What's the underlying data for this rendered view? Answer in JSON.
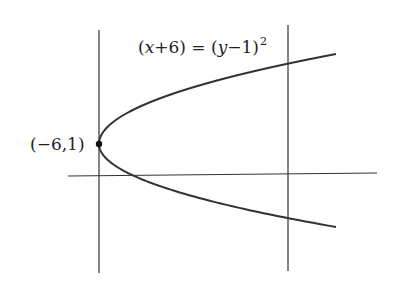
{
  "diagram": {
    "equation": {
      "lhs_open": "(",
      "var_x": "x",
      "lhs_rest": "+6) = (",
      "var_y": "y",
      "rhs_rest": "−1)",
      "exponent": "2"
    },
    "vertex_label": "(−6,1)",
    "colors": {
      "stroke": "#333333",
      "background": "#ffffff"
    }
  },
  "chart_data": {
    "type": "line",
    "curve": "parabola opening right, vertex (−6,1)",
    "vertex": {
      "x": -6,
      "y": 1,
      "label": "(−6,1)"
    },
    "lines": [
      {
        "kind": "vertical",
        "description": "line through vertex x = −6"
      },
      {
        "kind": "vertical",
        "description": "vertical line to the right"
      },
      {
        "kind": "horizontal",
        "description": "x-axis"
      }
    ],
    "grid": false,
    "legend": null
  }
}
